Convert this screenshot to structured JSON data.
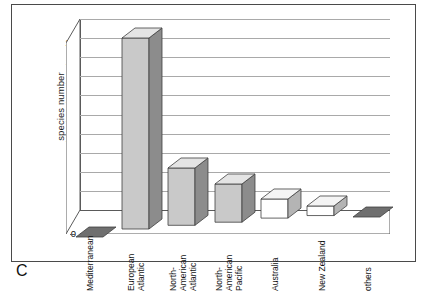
{
  "panel": {
    "letter": "C"
  },
  "chart_data": {
    "type": "bar",
    "title": "",
    "subtitle": "",
    "xlabel": "",
    "ylabel": "species number",
    "ylim": [
      0,
      20
    ],
    "ytick_step": 2,
    "yticks": [
      0,
      2,
      4,
      6,
      8,
      10,
      12,
      14,
      16,
      18,
      20
    ],
    "ytick_labels": [
      "0",
      "2",
      "4",
      "6",
      "8",
      "10",
      "12",
      "14",
      "16",
      "18",
      "20"
    ],
    "grid": "horizontal",
    "legend": "none",
    "three_d": true,
    "categories": [
      "Mediterranean",
      "European Atlantic",
      "North-American Atlantic",
      "North-American Pacific",
      "Australia",
      "New Zealand",
      "others"
    ],
    "category_label_lines": [
      [
        "Mediterranean"
      ],
      [
        "European",
        "Atlantic"
      ],
      [
        "North-",
        "American",
        "Atlantic"
      ],
      [
        "North-",
        "American",
        "Pacific"
      ],
      [
        "Australia"
      ],
      [
        "New Zealand"
      ],
      [
        "others"
      ]
    ],
    "values": [
      0,
      20,
      6,
      4,
      2,
      1,
      0
    ],
    "bar_fill_colors": [
      "#6f6f6f",
      "#c9c9c9",
      "#c9c9c9",
      "#c9c9c9",
      "#ffffff",
      "#ffffff",
      "#6f6f6f"
    ],
    "bar_side_colors": [
      "#4a4a4a",
      "#8c8c8c",
      "#8c8c8c",
      "#8c8c8c",
      "#b4b4b4",
      "#b4b4b4",
      "#4a4a4a"
    ],
    "bar_top_colors": [
      "#9a9a9a",
      "#e4e4e4",
      "#e4e4e4",
      "#e4e4e4",
      "#f4f4f4",
      "#f4f4f4",
      "#9a9a9a"
    ]
  },
  "style": {
    "grid_color": "#a9a9a9",
    "axis_color": "#5a5a5a",
    "frame_color": "#4a4a4a",
    "text_color": "#111111",
    "background": "#ffffff"
  }
}
